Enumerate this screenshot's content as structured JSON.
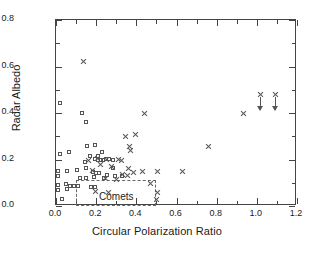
{
  "chart_data": {
    "type": "scatter",
    "title": "",
    "xlabel": "Circular Polarization Ratio",
    "ylabel": "Radar Albedo",
    "xlim": [
      0.0,
      1.2
    ],
    "ylim": [
      0.0,
      0.8
    ],
    "xticks": [
      0.0,
      0.2,
      0.4,
      0.6,
      0.8,
      1.0,
      1.2
    ],
    "xticklabels": [
      "0.0",
      "0.2",
      "0.4",
      "0.6",
      "0.8",
      "1.0",
      "1.2"
    ],
    "yticks": [
      0.0,
      0.2,
      0.4,
      0.6,
      0.8
    ],
    "yticklabels": [
      "0.0",
      "0.2",
      "0.4",
      "0.6",
      "0.8"
    ],
    "xminor_step": 0.1,
    "yminor_step": 0.1,
    "grid": false,
    "legend": null,
    "annotations": [
      {
        "name": "comets-region",
        "text": "Comets",
        "box": {
          "x0": 0.1,
          "x1": 0.5,
          "y0": 0.0,
          "y1": 0.112
        },
        "text_x": 0.3,
        "text_y": 0.042,
        "style": "dashed"
      }
    ],
    "series": [
      {
        "name": "squares",
        "marker": "open-square",
        "color": "#555555",
        "points": [
          [
            0.021,
            0.44
          ],
          [
            0.15,
            0.358
          ],
          [
            0.132,
            0.396
          ],
          [
            0.022,
            0.222
          ],
          [
            0.066,
            0.228
          ],
          [
            0.158,
            0.256
          ],
          [
            0.196,
            0.262
          ],
          [
            0.232,
            0.232
          ],
          [
            0.172,
            0.214
          ],
          [
            0.21,
            0.212
          ],
          [
            0.012,
            0.15
          ],
          [
            0.014,
            0.128
          ],
          [
            0.058,
            0.148
          ],
          [
            0.108,
            0.152
          ],
          [
            0.146,
            0.186
          ],
          [
            0.15,
            0.16
          ],
          [
            0.196,
            0.2
          ],
          [
            0.214,
            0.196
          ],
          [
            0.228,
            0.196
          ],
          [
            0.238,
            0.196
          ],
          [
            0.252,
            0.198
          ],
          [
            0.268,
            0.2
          ],
          [
            0.288,
            0.196
          ],
          [
            0.186,
            0.146
          ],
          [
            0.204,
            0.14
          ],
          [
            0.216,
            0.138
          ],
          [
            0.258,
            0.13
          ],
          [
            0.294,
            0.128
          ],
          [
            0.33,
            0.128
          ],
          [
            0.014,
            0.09
          ],
          [
            0.014,
            0.068
          ],
          [
            0.054,
            0.094
          ],
          [
            0.056,
            0.072
          ],
          [
            0.074,
            0.086
          ],
          [
            0.092,
            0.086
          ],
          [
            0.112,
            0.082
          ],
          [
            0.176,
            0.08
          ],
          [
            0.196,
            0.078
          ],
          [
            0.034,
            0.028
          ],
          [
            0.192,
            0.122
          ],
          [
            0.15,
            0.118
          ],
          [
            0.12,
            0.118
          ],
          [
            0.24,
            0.12
          ],
          [
            0.286,
            0.162
          ]
        ]
      },
      {
        "name": "crosses",
        "marker": "x",
        "color": "#555555",
        "points": [
          [
            0.136,
            0.622
          ],
          [
            0.44,
            0.4
          ],
          [
            0.348,
            0.3
          ],
          [
            0.396,
            0.306
          ],
          [
            0.368,
            0.258
          ],
          [
            0.372,
            0.238
          ],
          [
            0.16,
            0.196
          ],
          [
            0.31,
            0.198
          ],
          [
            0.324,
            0.196
          ],
          [
            0.222,
            0.178
          ],
          [
            0.276,
            0.17
          ],
          [
            0.36,
            0.162
          ],
          [
            0.386,
            0.146
          ],
          [
            0.43,
            0.15
          ],
          [
            0.504,
            0.148
          ],
          [
            0.332,
            0.136
          ],
          [
            0.356,
            0.132
          ],
          [
            0.246,
            0.118
          ],
          [
            0.3,
            0.116
          ],
          [
            0.196,
            0.062
          ],
          [
            0.262,
            0.058
          ],
          [
            0.472,
            0.096
          ],
          [
            0.504,
            0.058
          ],
          [
            0.498,
            0.03
          ],
          [
            0.628,
            0.148
          ],
          [
            0.76,
            0.258
          ],
          [
            0.934,
            0.398
          ],
          [
            0.252,
            0.2
          ],
          [
            0.208,
            0.204
          ],
          [
            0.184,
            0.152
          ]
        ]
      },
      {
        "name": "upper-limits",
        "marker": "x-with-down-arrow",
        "color": "#555555",
        "points": [
          [
            1.016,
            0.478
          ],
          [
            1.092,
            0.478
          ]
        ]
      }
    ]
  }
}
